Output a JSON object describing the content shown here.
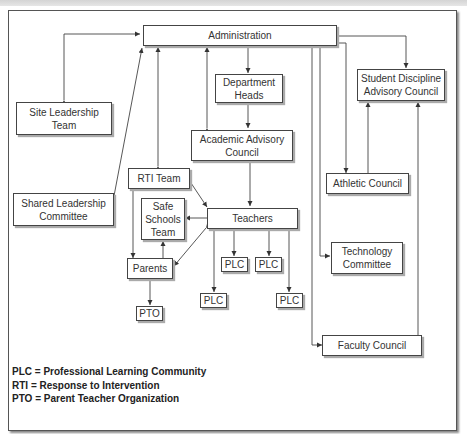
{
  "diagram": {
    "type": "organizational-chart",
    "nodes": {
      "administration": "Administration",
      "department_heads": "Department Heads",
      "site_leadership_team": "Site Leadership Team",
      "academic_advisory_council": "Academic Advisory Council",
      "student_discipline_advisory_council": "Student Discipline Advisory Council",
      "rti_team": "RTI Team",
      "shared_leadership_committee": "Shared Leadership Committee",
      "safe_schools_team": "Safe Schools Team",
      "teachers": "Teachers",
      "athletic_council": "Athletic Council",
      "parents": "Parents",
      "plc_1": "PLC",
      "plc_2": "PLC",
      "plc_3": "PLC",
      "plc_4": "PLC",
      "technology_committee": "Technology Committee",
      "pto": "PTO",
      "faculty_council": "Faculty Council"
    },
    "edges": [
      {
        "from": "Administration",
        "to": "Site Leadership Team",
        "direction": "both"
      },
      {
        "from": "Administration",
        "to": "Shared Leadership Committee",
        "direction": "both"
      },
      {
        "from": "Administration",
        "to": "RTI Team",
        "direction": "both"
      },
      {
        "from": "Administration",
        "to": "Academic Advisory Council",
        "direction": "both"
      },
      {
        "from": "Administration",
        "to": "Department Heads",
        "direction": "forward"
      },
      {
        "from": "Department Heads",
        "to": "Academic Advisory Council",
        "direction": "both"
      },
      {
        "from": "Academic Advisory Council",
        "to": "Teachers",
        "direction": "both"
      },
      {
        "from": "Administration",
        "to": "Student Discipline Advisory Council",
        "direction": "both"
      },
      {
        "from": "Administration",
        "to": "Athletic Council",
        "direction": "both"
      },
      {
        "from": "Athletic Council",
        "to": "Student Discipline Advisory Council",
        "direction": "forward"
      },
      {
        "from": "Faculty Council",
        "to": "Student Discipline Advisory Council",
        "direction": "both"
      },
      {
        "from": "Administration",
        "to": "Technology Committee",
        "direction": "both"
      },
      {
        "from": "Administration",
        "to": "Faculty Council",
        "direction": "both"
      },
      {
        "from": "RTI Team",
        "to": "Teachers",
        "direction": "forward"
      },
      {
        "from": "RTI Team",
        "to": "Parents",
        "direction": "forward"
      },
      {
        "from": "Teachers",
        "to": "Safe Schools Team",
        "direction": "forward"
      },
      {
        "from": "Parents",
        "to": "Safe Schools Team",
        "direction": "forward"
      },
      {
        "from": "Teachers",
        "to": "Parents",
        "direction": "both"
      },
      {
        "from": "Parents",
        "to": "PTO",
        "direction": "forward"
      },
      {
        "from": "Teachers",
        "to": "PLC",
        "direction": "both"
      },
      {
        "from": "Teachers",
        "to": "PLC",
        "direction": "both"
      },
      {
        "from": "Teachers",
        "to": "PLC",
        "direction": "both"
      },
      {
        "from": "Teachers",
        "to": "PLC",
        "direction": "both"
      }
    ]
  },
  "legend": {
    "plc": "PLC = Professional Learning Community",
    "rti": "RTI = Response to Intervention",
    "pto": "PTO = Parent Teacher Organization"
  }
}
